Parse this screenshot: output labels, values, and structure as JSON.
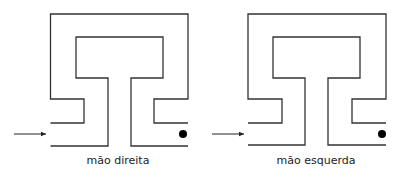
{
  "colors": {
    "line": "#333333",
    "dot": "#000000",
    "background": "#ffffff"
  },
  "mazes": [
    {
      "id": "right-hand",
      "label": "mão direita",
      "entrance_arrow": "arrow-right-icon",
      "goal_marker": "dot-icon"
    },
    {
      "id": "left-hand",
      "label": "mão esquerda",
      "entrance_arrow": "arrow-right-icon",
      "goal_marker": "dot-icon"
    }
  ]
}
